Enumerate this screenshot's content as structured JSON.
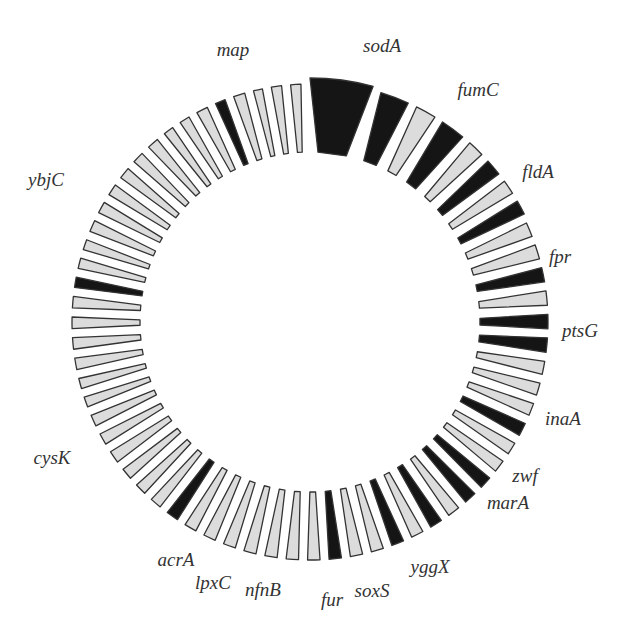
{
  "diagram": {
    "type": "circular-gene-ring",
    "center": [
      310,
      322
    ],
    "inner_radius": 170,
    "colors": {
      "highlight": "#151515",
      "normal": "#dcdcdc",
      "stroke": "#333333"
    },
    "segments": [
      {
        "gene": "sodA",
        "highlight": true,
        "width_deg": 15,
        "length": 74
      },
      {
        "gene": "fumC",
        "highlight": true,
        "width_deg": 7,
        "length": 70
      },
      {
        "gene": "",
        "highlight": false,
        "width_deg": 5,
        "length": 70
      },
      {
        "gene": "fldA",
        "highlight": true,
        "width_deg": 6,
        "length": 70
      },
      {
        "gene": "",
        "highlight": false,
        "width_deg": 4,
        "length": 70
      },
      {
        "gene": "fpr",
        "highlight": true,
        "width_deg": 4,
        "length": 70
      },
      {
        "gene": "",
        "highlight": false,
        "width_deg": 3.5,
        "length": 70
      },
      {
        "gene": "ptsG",
        "highlight": true,
        "width_deg": 3.5,
        "length": 70
      },
      {
        "gene": "",
        "highlight": false,
        "width_deg": 3.5,
        "length": 68
      },
      {
        "gene": "",
        "highlight": false,
        "width_deg": 3.5,
        "length": 68
      },
      {
        "gene": "inaA",
        "highlight": true,
        "width_deg": 3.5,
        "length": 68
      },
      {
        "gene": "",
        "highlight": false,
        "width_deg": 3.5,
        "length": 68
      },
      {
        "gene": "zwf",
        "highlight": true,
        "width_deg": 3.5,
        "length": 68
      },
      {
        "gene": "marA",
        "highlight": true,
        "width_deg": 3.5,
        "length": 68
      },
      {
        "gene": "",
        "highlight": false,
        "width_deg": 3.2,
        "length": 68
      },
      {
        "gene": "",
        "highlight": false,
        "width_deg": 3,
        "length": 68
      },
      {
        "gene": "",
        "highlight": false,
        "width_deg": 3,
        "length": 68
      },
      {
        "gene": "yggX",
        "highlight": true,
        "width_deg": 3.2,
        "length": 68
      },
      {
        "gene": "",
        "highlight": false,
        "width_deg": 3,
        "length": 68
      },
      {
        "gene": "soxS",
        "highlight": false,
        "width_deg": 3,
        "length": 68
      },
      {
        "gene": "",
        "highlight": true,
        "width_deg": 3,
        "length": 68
      },
      {
        "gene": "fur",
        "highlight": true,
        "width_deg": 3,
        "length": 68
      },
      {
        "gene": "",
        "highlight": false,
        "width_deg": 3,
        "length": 68
      },
      {
        "gene": "",
        "highlight": true,
        "width_deg": 3,
        "length": 68
      },
      {
        "gene": "nfnB",
        "highlight": false,
        "width_deg": 3,
        "length": 68
      },
      {
        "gene": "",
        "highlight": true,
        "width_deg": 3,
        "length": 68
      },
      {
        "gene": "lpxC",
        "highlight": false,
        "width_deg": 3,
        "length": 68
      },
      {
        "gene": "",
        "highlight": false,
        "width_deg": 3,
        "length": 68
      },
      {
        "gene": "acrA",
        "highlight": true,
        "width_deg": 3,
        "length": 68
      },
      {
        "gene": "",
        "highlight": false,
        "width_deg": 3,
        "length": 68
      },
      {
        "gene": "",
        "highlight": false,
        "width_deg": 3,
        "length": 68
      },
      {
        "gene": "",
        "highlight": false,
        "width_deg": 3,
        "length": 68
      },
      {
        "gene": "",
        "highlight": false,
        "width_deg": 3,
        "length": 68
      },
      {
        "gene": "",
        "highlight": false,
        "width_deg": 3,
        "length": 68
      },
      {
        "gene": "",
        "highlight": false,
        "width_deg": 3,
        "length": 68
      },
      {
        "gene": "",
        "highlight": false,
        "width_deg": 3,
        "length": 68
      },
      {
        "gene": "cysK",
        "highlight": true,
        "width_deg": 3,
        "length": 68
      },
      {
        "gene": "",
        "highlight": false,
        "width_deg": 2.8,
        "length": 68
      },
      {
        "gene": "",
        "highlight": false,
        "width_deg": 2.8,
        "length": 68
      },
      {
        "gene": "",
        "highlight": false,
        "width_deg": 2.8,
        "length": 68
      },
      {
        "gene": "",
        "highlight": false,
        "width_deg": 3,
        "length": 68
      },
      {
        "gene": "",
        "highlight": false,
        "width_deg": 2.8,
        "length": 68
      },
      {
        "gene": "",
        "highlight": false,
        "width_deg": 2.8,
        "length": 68
      },
      {
        "gene": "",
        "highlight": false,
        "width_deg": 2.5,
        "length": 68
      },
      {
        "gene": "",
        "highlight": false,
        "width_deg": 2.5,
        "length": 68
      },
      {
        "gene": "",
        "highlight": false,
        "width_deg": 2.8,
        "length": 68
      },
      {
        "gene": "",
        "highlight": false,
        "width_deg": 2.8,
        "length": 68
      },
      {
        "gene": "",
        "highlight": false,
        "width_deg": 2.8,
        "length": 68
      },
      {
        "gene": "",
        "highlight": false,
        "width_deg": 2.8,
        "length": 68
      },
      {
        "gene": "ybjC",
        "highlight": true,
        "width_deg": 2.5,
        "length": 68
      },
      {
        "gene": "",
        "highlight": false,
        "width_deg": 2.5,
        "length": 68
      },
      {
        "gene": "",
        "highlight": false,
        "width_deg": 2.5,
        "length": 68
      },
      {
        "gene": "",
        "highlight": false,
        "width_deg": 2.8,
        "length": 68
      },
      {
        "gene": "",
        "highlight": false,
        "width_deg": 2.8,
        "length": 68
      },
      {
        "gene": "",
        "highlight": false,
        "width_deg": 2.8,
        "length": 68
      },
      {
        "gene": "",
        "highlight": false,
        "width_deg": 2.8,
        "length": 68
      },
      {
        "gene": "",
        "highlight": false,
        "width_deg": 2.8,
        "length": 68
      },
      {
        "gene": "",
        "highlight": false,
        "width_deg": 2.8,
        "length": 68
      },
      {
        "gene": "",
        "highlight": false,
        "width_deg": 2.5,
        "length": 68
      },
      {
        "gene": "",
        "highlight": false,
        "width_deg": 2.5,
        "length": 68
      },
      {
        "gene": "",
        "highlight": false,
        "width_deg": 2.8,
        "length": 68
      },
      {
        "gene": "map",
        "highlight": true,
        "width_deg": 2.5,
        "length": 68
      },
      {
        "gene": "",
        "highlight": false,
        "width_deg": 2.8,
        "length": 68
      },
      {
        "gene": "",
        "highlight": false,
        "width_deg": 2.2,
        "length": 68
      },
      {
        "gene": "",
        "highlight": false,
        "width_deg": 2.5,
        "length": 68
      },
      {
        "gene": "",
        "highlight": false,
        "width_deg": 2.5,
        "length": 68
      }
    ],
    "labels": [
      {
        "text": "sodA",
        "x": 382,
        "y": 46
      },
      {
        "text": "fumC",
        "x": 478,
        "y": 90
      },
      {
        "text": "fldA",
        "x": 538,
        "y": 172
      },
      {
        "text": "fpr",
        "x": 560,
        "y": 257
      },
      {
        "text": "ptsG",
        "x": 580,
        "y": 331
      },
      {
        "text": "inaA",
        "x": 563,
        "y": 419
      },
      {
        "text": "zwf",
        "x": 525,
        "y": 476
      },
      {
        "text": "marA",
        "x": 508,
        "y": 503
      },
      {
        "text": "yggX",
        "x": 430,
        "y": 567
      },
      {
        "text": "soxS",
        "x": 372,
        "y": 591
      },
      {
        "text": "fur",
        "x": 332,
        "y": 600
      },
      {
        "text": "nfnB",
        "x": 263,
        "y": 590
      },
      {
        "text": "lpxC",
        "x": 213,
        "y": 583
      },
      {
        "text": "acrA",
        "x": 176,
        "y": 560
      },
      {
        "text": "cysK",
        "x": 52,
        "y": 458
      },
      {
        "text": "ybjC",
        "x": 46,
        "y": 180
      },
      {
        "text": "map",
        "x": 233,
        "y": 50
      }
    ]
  }
}
